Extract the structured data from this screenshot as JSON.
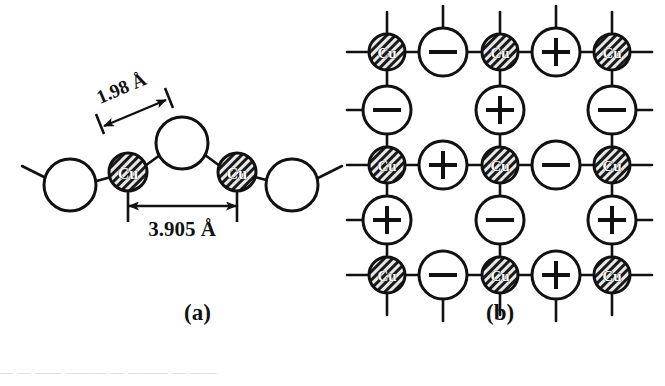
{
  "figure": {
    "panels": [
      {
        "id": "a",
        "label": "(a)",
        "name": "side-view-cuo2-chain",
        "dimensions": [
          {
            "name": "cu-o-bond-length",
            "text": "1.98 Å",
            "value": 1.98,
            "unit": "Å",
            "orientation": "diagonal"
          },
          {
            "name": "cu-cu-spacing",
            "text": "3.905 Å",
            "value": 3.905,
            "unit": "Å",
            "orientation": "horizontal"
          }
        ],
        "atoms": [
          {
            "name": "oxygen-left",
            "label": "",
            "type": "oxygen",
            "cx": 70,
            "cy": 185,
            "r": 26
          },
          {
            "name": "copper-left",
            "label": "Cu",
            "type": "copper",
            "cx": 128,
            "cy": 172,
            "r": 19
          },
          {
            "name": "oxygen-apex",
            "label": "",
            "type": "oxygen",
            "cx": 182,
            "cy": 143,
            "r": 26
          },
          {
            "name": "copper-right",
            "label": "Cu",
            "type": "copper",
            "cx": 237,
            "cy": 172,
            "r": 19
          },
          {
            "name": "oxygen-right",
            "label": "",
            "type": "oxygen",
            "cx": 292,
            "cy": 185,
            "r": 26
          }
        ]
      },
      {
        "id": "b",
        "label": "(b)",
        "name": "top-view-cuo2-plane-lattice",
        "legend_symbols": {
          "copper": "Cu",
          "positive": "+",
          "negative": "−"
        },
        "grid": {
          "columns_x": [
            387,
            443,
            500,
            556,
            612
          ],
          "rows_y": [
            52,
            110,
            165,
            220,
            275
          ],
          "copper_radius": 18,
          "oxygen_radius": 24
        },
        "lattice_rows": [
          [
            "Cu",
            "-",
            "Cu",
            "+",
            "Cu"
          ],
          [
            "-",
            "",
            "+",
            "",
            "-"
          ],
          [
            "Cu",
            "+",
            "Cu",
            "-",
            "Cu"
          ],
          [
            "+",
            "",
            "-",
            "",
            "+"
          ],
          [
            "Cu",
            "-",
            "Cu",
            "+",
            "Cu"
          ]
        ]
      }
    ],
    "colors": {
      "stroke": "#111111",
      "copper_fill": "#6f6f6f",
      "oxygen_fill": "#ffffff",
      "background": "#ffffff"
    },
    "cut_off_caption": "—  —  ——  ———   —   ———  — ——"
  }
}
